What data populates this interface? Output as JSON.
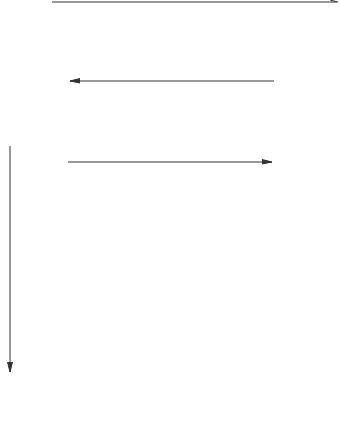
{
  "palette": {
    "dark": "#5a5a5a",
    "medium": "#9a9a9a",
    "light": "#c8c8c8",
    "white": "#ffffff",
    "line": "#333333"
  },
  "block_styles": {
    "A": {
      "star": "dark",
      "check_a": "light",
      "check_b": "medium",
      "corner_a": "medium",
      "corner_b": "white",
      "center_white": false
    },
    "B": {
      "star": "light",
      "check_a": "dark",
      "check_b": "white",
      "corner_a": "light",
      "corner_b": "white",
      "center_white": true
    },
    "C": {
      "star": "medium",
      "check_a": "medium",
      "check_b": "light",
      "corner_a": "medium",
      "corner_b": "white",
      "center_white": false
    },
    "D": {
      "star": "medium",
      "check_a": "light",
      "check_b": "white",
      "corner_a": "light",
      "corner_b": "white",
      "center_white": false
    },
    "E": {
      "star": "medium",
      "check_a": "dark",
      "check_b": "light",
      "corner_a": "medium",
      "corner_b": "white",
      "center_white": false
    }
  },
  "top_row": {
    "arrow": {
      "direction": "right",
      "label": ""
    },
    "blocks": [
      {
        "x": 0,
        "y": 6,
        "w": 62,
        "h": 63,
        "style": "A"
      },
      {
        "x": 70,
        "y": 6,
        "w": 62,
        "h": 63,
        "style": "B"
      },
      {
        "x": 140,
        "y": 6,
        "w": 62,
        "h": 63,
        "style": "C"
      },
      {
        "x": 209,
        "y": 6,
        "w": 62,
        "h": 63,
        "style": "D"
      },
      {
        "x": 277,
        "y": 6,
        "w": 62,
        "h": 63,
        "style": "E"
      }
    ]
  },
  "middle_row": {
    "arrow_top": {
      "direction": "left"
    },
    "arrow_bottom": {
      "direction": "right"
    },
    "blocks": [
      "B",
      "A",
      "B",
      "A",
      "B"
    ]
  },
  "quilt_grid": {
    "rows": 4,
    "cols": 5,
    "arrow_side": {
      "direction": "down"
    },
    "blocks": [
      [
        "A",
        "B",
        "E",
        "D",
        "A"
      ],
      [
        "B",
        "D",
        "A",
        "C",
        "B"
      ],
      [
        "A",
        "B",
        "E",
        "D",
        "A"
      ],
      [
        "B",
        "A",
        "B",
        "A",
        "D"
      ]
    ]
  }
}
